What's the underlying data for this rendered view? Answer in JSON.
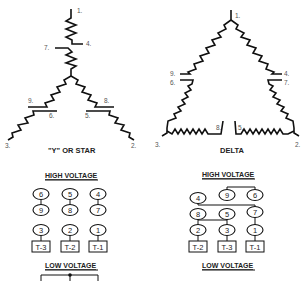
{
  "star": {
    "title": "\"Y\" OR STAR",
    "labels": {
      "t1": "1.",
      "t2": "2.",
      "t3": "3.",
      "t4": "4.",
      "t5": "5.",
      "t6": "6.",
      "t7": "7.",
      "t8": "8.",
      "t9": "9."
    }
  },
  "delta": {
    "title": "DELTA",
    "labels": {
      "t1": "1.",
      "t2": "2.",
      "t3": "3.",
      "t4": "4.",
      "t5": "5.",
      "t6": "6.",
      "t7": "7.",
      "t8": "8.",
      "t9": "9."
    }
  },
  "star_terminals": {
    "high_voltage_label": "HIGH VOLTAGE",
    "low_voltage_label": "LOW VOLTAGE",
    "top_row": [
      "6",
      "5",
      "4"
    ],
    "mid_row": [
      "9",
      "8",
      "7"
    ],
    "line_row": [
      "3",
      "2",
      "1"
    ],
    "leads": [
      "T-3",
      "T-2",
      "T-1"
    ]
  },
  "delta_terminals": {
    "high_voltage_label": "HIGH VOLTAGE",
    "low_voltage_label": "LOW VOLTAGE",
    "row1": [
      "4",
      "9",
      "6"
    ],
    "row2": [
      "8",
      "5",
      "7"
    ],
    "line_row": [
      "2",
      "3",
      "1"
    ],
    "leads": [
      "T-2",
      "T-3",
      "T-1"
    ]
  }
}
